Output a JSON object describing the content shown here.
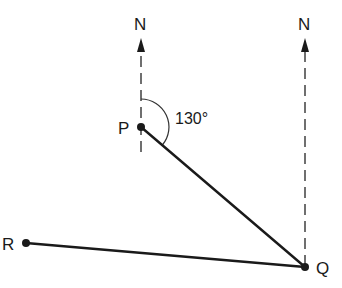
{
  "diagram": {
    "type": "bearing-diagram",
    "points": {
      "P": {
        "label": "P",
        "x": 141,
        "y": 127
      },
      "Q": {
        "label": "Q",
        "x": 305,
        "y": 267
      },
      "R": {
        "label": "R",
        "x": 26,
        "y": 243
      }
    },
    "north_markers": [
      {
        "label": "N",
        "at_point": "P"
      },
      {
        "label": "N",
        "at_point": "Q"
      }
    ],
    "segments": [
      {
        "from": "P",
        "to": "Q"
      },
      {
        "from": "R",
        "to": "Q"
      }
    ],
    "angle": {
      "vertex": "P",
      "value": "130°",
      "description": "bearing of Q from P"
    },
    "colors": {
      "ink": "#1a1a1a",
      "background": "#ffffff"
    }
  }
}
